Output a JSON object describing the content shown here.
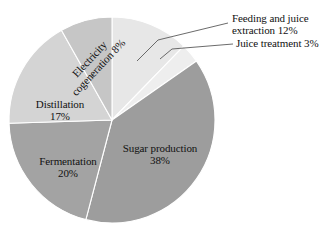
{
  "chart_data": {
    "type": "pie",
    "title": "",
    "subtitle": "",
    "xlabel": "",
    "ylabel": "",
    "legend_position": "none",
    "grid": false,
    "units": "%",
    "categories": [
      "Feeding and juice extraction",
      "Juice treatment",
      "Sugar production",
      "Fermentation",
      "Distillation",
      "Electricity cogeneration"
    ],
    "values": [
      12,
      3,
      38,
      20,
      17,
      8
    ],
    "start_angle_deg": 0,
    "direction": "clockwise",
    "slices": [
      {
        "name": "feeding-and-juice-extraction",
        "label": "Feeding and juice",
        "label_line2": "extraction 12%",
        "full_label": "Feeding and juice extraction 12%",
        "value": 12,
        "value_text": "12%",
        "color": "#e7e7e7",
        "label_placement": "outside",
        "leader": true
      },
      {
        "name": "juice-treatment",
        "label": "Juice treatment 3%",
        "label_line2": "",
        "full_label": "Juice treatment 3%",
        "value": 3,
        "value_text": "3%",
        "color": "#eeeeee",
        "label_placement": "outside",
        "leader": true
      },
      {
        "name": "sugar-production",
        "label": "Sugar production",
        "label_line2": "38%",
        "full_label": "Sugar production 38%",
        "value": 38,
        "value_text": "38%",
        "color": "#9d9d9d",
        "label_placement": "inside",
        "leader": false
      },
      {
        "name": "fermentation",
        "label": "Fermentation",
        "label_line2": "20%",
        "full_label": "Fermentation 20%",
        "value": 20,
        "value_text": "20%",
        "color": "#a3a3a3",
        "label_placement": "inside",
        "leader": false
      },
      {
        "name": "distillation",
        "label": "Distillation",
        "label_line2": "17%",
        "full_label": "Distillation 17%",
        "value": 17,
        "value_text": "17%",
        "color": "#d4d4d4",
        "label_placement": "inside",
        "leader": false
      },
      {
        "name": "electricity-cogeneration",
        "label": "Electricity",
        "label_line2": "cogeneration 8%",
        "full_label": "Electricity cogeneration 8%",
        "value": 8,
        "value_text": "8%",
        "color": "#c6c6c6",
        "label_placement": "inside-rotated",
        "rotation_deg": -47,
        "leader": false
      }
    ],
    "geometry": {
      "center_x": 112,
      "center_y": 120,
      "radius": 103
    },
    "colors": {
      "background": "#ffffff",
      "text": "#111111",
      "slice_border": "#ffffff",
      "leader_line": "#5a5a5a"
    }
  }
}
